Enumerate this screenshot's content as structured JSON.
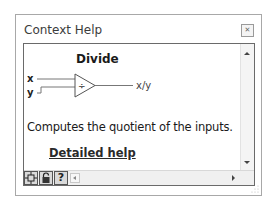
{
  "window": {
    "title": "Context Help",
    "close_icon": "close-icon"
  },
  "content": {
    "heading": "Divide",
    "diagram": {
      "inputs": [
        "x",
        "y"
      ],
      "operator_symbol": "÷",
      "output": "x/y"
    },
    "description": "Computes the quotient of the inputs.",
    "link_label": "Detailed help"
  },
  "toolbar": {
    "buttons": [
      {
        "name": "show-optional-terminals",
        "icon": "terminals-icon"
      },
      {
        "name": "lock-context-help",
        "icon": "lock-icon"
      },
      {
        "name": "detailed-help",
        "icon": "question-icon",
        "label": "?"
      }
    ]
  },
  "colors": {
    "border": "#a8a8a8",
    "pane_border": "#6a6a6a",
    "text": "#1a1a1a",
    "toolbar_bg": "#f0f0f0"
  }
}
